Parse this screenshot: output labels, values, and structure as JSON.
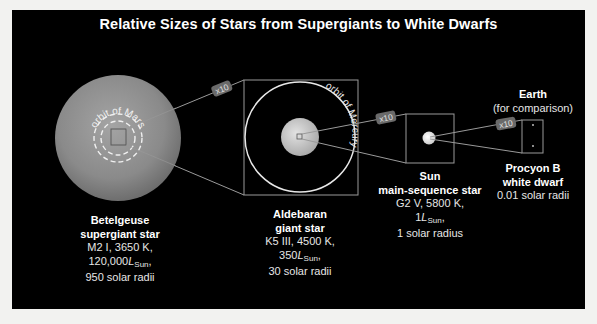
{
  "title": "Relative Sizes of Stars from Supergiants to White Dwarfs",
  "zoom_label": "x10",
  "stars": [
    {
      "name": "Betelgeuse",
      "type": "supergiant star",
      "spectral": "M2 I, 3650 K,",
      "lum_value": "120,000",
      "lum_symbol": "L",
      "lum_sub": "Sun",
      "lum_suffix": ",",
      "radius": "950 solar radii",
      "orbit_label": "orbit of Mars"
    },
    {
      "name": "Aldebaran",
      "type": "giant star",
      "spectral": "K5 III, 4500 K,",
      "lum_value": "350",
      "lum_symbol": "L",
      "lum_sub": "Sun",
      "lum_suffix": ",",
      "radius": "30 solar radii",
      "orbit_label": "orbit of Mercury"
    },
    {
      "name": "Sun",
      "type": "main-sequence star",
      "spectral": "G2 V, 5800 K,",
      "lum_value": "1",
      "lum_symbol": "L",
      "lum_sub": "Sun",
      "lum_suffix": ",",
      "radius": "1 solar radius"
    },
    {
      "name": "Procyon B",
      "type": "white dwarf",
      "radius": "0.01 solar radii"
    }
  ],
  "earth": {
    "name": "Earth",
    "note": "(for comparison)"
  },
  "colors": {
    "background": "#000000",
    "page": "#f2f2f0",
    "betelgeuse": "#8e8e8e",
    "aldebaran": "#c8c8c8",
    "sun": "#e8e8e8",
    "lines": "#9a9a9a",
    "tag": "#6a6a6a"
  }
}
